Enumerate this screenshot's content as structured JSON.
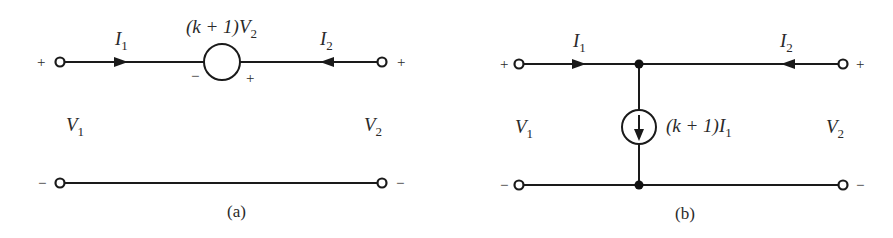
{
  "figure": {
    "panels": [
      {
        "id": "a",
        "caption": "(a)",
        "source": {
          "type": "dependent-voltage-source",
          "label_prefix": "(k + 1)",
          "label_var": "V",
          "label_sub": "2",
          "minus_sign": "−",
          "plus_sign": "+"
        },
        "ports": {
          "left": {
            "plus": "+",
            "minus": "−",
            "voltage_var": "V",
            "voltage_sub": "1",
            "current_var": "I",
            "current_sub": "1"
          },
          "right": {
            "plus": "+",
            "minus": "−",
            "voltage_var": "V",
            "voltage_sub": "2",
            "current_var": "I",
            "current_sub": "2"
          }
        }
      },
      {
        "id": "b",
        "caption": "(b)",
        "source": {
          "type": "dependent-current-source",
          "label_prefix": "(k + 1)",
          "label_var": "I",
          "label_sub": "1"
        },
        "ports": {
          "left": {
            "plus": "+",
            "minus": "−",
            "voltage_var": "V",
            "voltage_sub": "1",
            "current_var": "I",
            "current_sub": "1"
          },
          "right": {
            "plus": "+",
            "minus": "−",
            "voltage_var": "V",
            "voltage_sub": "2",
            "current_var": "I",
            "current_sub": "2"
          }
        }
      }
    ],
    "colors": {
      "ink": "#1a1a1a",
      "background": "#ffffff"
    }
  }
}
